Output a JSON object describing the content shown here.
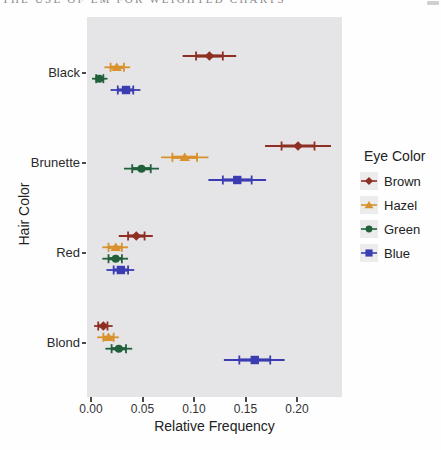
{
  "header": {
    "clipped_text": "THE USE OF EM FOR WEIGHTED CHARTS"
  },
  "chart_data": {
    "type": "scatter",
    "subtype": "point-interval",
    "title": "",
    "xlabel": "Relative Frequency",
    "ylabel": "Hair Color",
    "categories": [
      "Black",
      "Brunette",
      "Red",
      "Blond"
    ],
    "x_ticks": [
      {
        "value": 0.0,
        "label": "0.00"
      },
      {
        "value": 0.05,
        "label": "0.05"
      },
      {
        "value": 0.1,
        "label": "0.10"
      },
      {
        "value": 0.15,
        "label": "0.15"
      },
      {
        "value": 0.2,
        "label": "0.20"
      }
    ],
    "xlim": [
      -0.004,
      0.2435
    ],
    "grid": false,
    "panel_bg": "#e5e4e7",
    "legend": {
      "title": "Eye Color",
      "position": "right"
    },
    "series": [
      {
        "name": "Brown",
        "marker": "diamond",
        "color": "#8e2f23",
        "points": [
          {
            "category": "Black",
            "x": 0.115,
            "inner": [
              0.102,
              0.128
            ],
            "outer": [
              0.089,
              0.141
            ]
          },
          {
            "category": "Brunette",
            "x": 0.201,
            "inner": [
              0.185,
              0.217
            ],
            "outer": [
              0.169,
              0.233
            ]
          },
          {
            "category": "Red",
            "x": 0.044,
            "inner": [
              0.036,
              0.052
            ],
            "outer": [
              0.027,
              0.06
            ]
          },
          {
            "category": "Blond",
            "x": 0.012,
            "inner": [
              0.007,
              0.016
            ],
            "outer": [
              0.003,
              0.021
            ]
          }
        ]
      },
      {
        "name": "Hazel",
        "marker": "triangle",
        "color": "#d8912c",
        "points": [
          {
            "category": "Black",
            "x": 0.025,
            "inner": [
              0.019,
              0.032
            ],
            "outer": [
              0.013,
              0.038
            ]
          },
          {
            "category": "Brunette",
            "x": 0.091,
            "inner": [
              0.079,
              0.103
            ],
            "outer": [
              0.068,
              0.114
            ]
          },
          {
            "category": "Red",
            "x": 0.024,
            "inner": [
              0.017,
              0.03
            ],
            "outer": [
              0.011,
              0.036
            ]
          },
          {
            "category": "Blond",
            "x": 0.017,
            "inner": [
              0.012,
              0.022
            ],
            "outer": [
              0.006,
              0.027
            ]
          }
        ]
      },
      {
        "name": "Green",
        "marker": "circle",
        "color": "#21603a",
        "points": [
          {
            "category": "Black",
            "x": 0.008,
            "inner": [
              0.005,
              0.012
            ],
            "outer": [
              0.001,
              0.016
            ]
          },
          {
            "category": "Brunette",
            "x": 0.049,
            "inner": [
              0.04,
              0.058
            ],
            "outer": [
              0.032,
              0.066
            ]
          },
          {
            "category": "Red",
            "x": 0.024,
            "inner": [
              0.017,
              0.03
            ],
            "outer": [
              0.011,
              0.036
            ]
          },
          {
            "category": "Blond",
            "x": 0.027,
            "inner": [
              0.02,
              0.034
            ],
            "outer": [
              0.014,
              0.04
            ]
          }
        ]
      },
      {
        "name": "Blue",
        "marker": "square",
        "color": "#3c3cb2",
        "points": [
          {
            "category": "Black",
            "x": 0.034,
            "inner": [
              0.026,
              0.041
            ],
            "outer": [
              0.019,
              0.048
            ]
          },
          {
            "category": "Brunette",
            "x": 0.142,
            "inner": [
              0.128,
              0.156
            ],
            "outer": [
              0.114,
              0.17
            ]
          },
          {
            "category": "Red",
            "x": 0.029,
            "inner": [
              0.022,
              0.036
            ],
            "outer": [
              0.015,
              0.042
            ]
          },
          {
            "category": "Blond",
            "x": 0.159,
            "inner": [
              0.144,
              0.174
            ],
            "outer": [
              0.129,
              0.188
            ]
          }
        ]
      }
    ]
  }
}
